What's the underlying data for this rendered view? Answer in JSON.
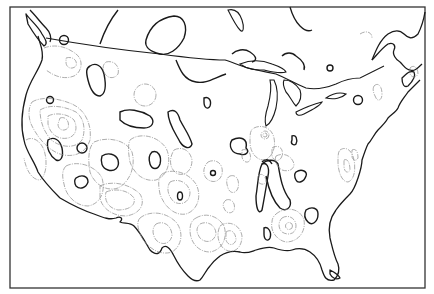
{
  "map": {
    "title": "",
    "region": "Contiguous United States and southern Canada",
    "style": "hachured contour map, monochrome",
    "colors": {
      "background": "#ffffff",
      "coastline": "#1a1a1a",
      "bold_contour": "#1a1a1a",
      "thin_contour": "#8a8a8a",
      "frame": "#333333"
    },
    "layers": [
      "coastline",
      "us-canada-border",
      "great-lakes",
      "bold-contours",
      "hachured-contours"
    ],
    "labels": []
  }
}
